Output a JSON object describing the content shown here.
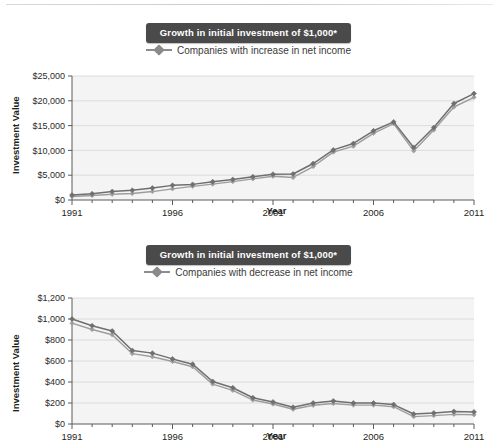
{
  "page": {
    "background": "#ffffff",
    "accent_dark": "#4a4a4a",
    "series_color": "#7a7a7a",
    "series_color_2": "#9a9a9a"
  },
  "charts": [
    {
      "id": "increase",
      "title": "Growth in initial investment of $1,000*",
      "legend_label": "Companies with increase in net income",
      "ylabel": "Investment Value",
      "xlabel": "Year",
      "ytick_labels": [
        "$0",
        "$5,000",
        "$10,000",
        "$15,000",
        "$20,000",
        "$25,000"
      ],
      "xtick_labels": [
        "1991",
        "1996",
        "2001",
        "2006",
        "2011"
      ]
    },
    {
      "id": "decrease",
      "title": "Growth in initial investment of $1,000*",
      "legend_label": "Companies with decrease in net income",
      "ylabel": "Investment Value",
      "xlabel": "Year",
      "ytick_labels": [
        "$0",
        "$200",
        "$400",
        "$600",
        "$800",
        "$1,000",
        "$1,200"
      ],
      "xtick_labels": [
        "1991",
        "1996",
        "2001",
        "2006",
        "2011"
      ]
    }
  ],
  "chart_data": [
    {
      "type": "line",
      "title": "Growth in initial investment of $1,000*",
      "xlabel": "Year",
      "ylabel": "Investment Value",
      "xlim": [
        1991,
        2011
      ],
      "ylim": [
        0,
        25000
      ],
      "ytick_values": [
        0,
        5000,
        10000,
        15000,
        20000,
        25000
      ],
      "xtick_values": [
        1991,
        1996,
        2001,
        2006,
        2011
      ],
      "grid": true,
      "legend_position": "top-center",
      "x": [
        1991,
        1992,
        1993,
        1994,
        1995,
        1996,
        1997,
        1998,
        1999,
        2000,
        2001,
        2002,
        2003,
        2004,
        2005,
        2006,
        2007,
        2008,
        2009,
        2010,
        2011
      ],
      "series": [
        {
          "name": "Companies with increase in net income",
          "values": [
            1000,
            1250,
            1700,
            1950,
            2400,
            2950,
            3150,
            3700,
            4150,
            4700,
            5200,
            5250,
            7350,
            10100,
            11400,
            13950,
            15750,
            10600,
            14600,
            19450,
            21450
          ]
        },
        {
          "name": "Companies with increase in net income (second line)",
          "values": [
            700,
            900,
            1150,
            1300,
            1700,
            2250,
            2750,
            3200,
            3700,
            4250,
            4800,
            4550,
            6750,
            9650,
            10850,
            13450,
            15400,
            9900,
            14100,
            18750,
            20700
          ]
        }
      ]
    },
    {
      "type": "line",
      "title": "Growth in initial investment of $1,000*",
      "xlabel": "Year",
      "ylabel": "Investment Value",
      "xlim": [
        1991,
        2011
      ],
      "ylim": [
        0,
        1200
      ],
      "ytick_values": [
        0,
        200,
        400,
        600,
        800,
        1000,
        1200
      ],
      "xtick_values": [
        1991,
        1996,
        2001,
        2006,
        2011
      ],
      "grid": true,
      "legend_position": "top-center",
      "x": [
        1991,
        1992,
        1993,
        1994,
        1995,
        1996,
        1997,
        1998,
        1999,
        2000,
        2001,
        2002,
        2003,
        2004,
        2005,
        2006,
        2007,
        2008,
        2009,
        2010,
        2011
      ],
      "series": [
        {
          "name": "Companies with decrease in net income",
          "values": [
            1000,
            935,
            885,
            700,
            675,
            620,
            570,
            405,
            345,
            250,
            210,
            160,
            200,
            220,
            200,
            200,
            185,
            95,
            105,
            120,
            115
          ]
        },
        {
          "name": "Companies with decrease in net income (shadow line)",
          "values": [
            960,
            900,
            850,
            670,
            640,
            595,
            545,
            380,
            320,
            228,
            190,
            140,
            178,
            195,
            180,
            180,
            165,
            70,
            80,
            92,
            88
          ]
        }
      ]
    }
  ]
}
